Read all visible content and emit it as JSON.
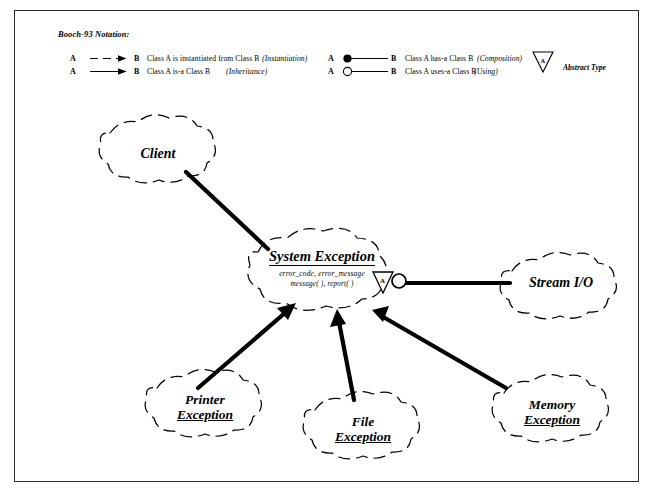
{
  "page": {
    "background": "#ffffff",
    "ink": "#000000",
    "frame_color": "#2b2b2b"
  },
  "legend": {
    "title": "Booch-93 Notation:",
    "rows": [
      {
        "id": "instantiation",
        "from": "A",
        "to": "B",
        "line_style": "dashed",
        "arrow": "solid-triangle",
        "description": "Class A  is instantiated from  Class B",
        "kind": "(Instantiation)"
      },
      {
        "id": "inheritance",
        "from": "A",
        "to": "B",
        "line_style": "solid",
        "arrow": "solid-triangle",
        "description": "Class A  is-a Class B",
        "kind": "(Inheritance)"
      },
      {
        "id": "composition",
        "from": "A",
        "to": "B",
        "line_style": "solid",
        "arrow": "filled-circle",
        "description": "Class A  has-a  Class B",
        "kind": "(Composition)"
      },
      {
        "id": "using",
        "from": "A",
        "to": "B",
        "line_style": "solid",
        "arrow": "open-circle",
        "description": "Class A  uses-a Class B",
        "kind": "(Using)"
      }
    ],
    "abstract_marker": {
      "glyph": "A",
      "label": "Abstract Type"
    }
  },
  "classes": [
    {
      "id": "client",
      "name": "Client",
      "lines": [
        "Client"
      ],
      "underline_first_letter": false
    },
    {
      "id": "system-exception",
      "name": "System Exception",
      "attributes": "error_code, error_message",
      "operations": "message( ), report( )",
      "abstract_glyph": "A",
      "is_abstract": true
    },
    {
      "id": "stream-io",
      "name": "Stream I/O",
      "lines": [
        "Stream I/O"
      ]
    },
    {
      "id": "printer-exception",
      "name": "Printer Exception",
      "lines": [
        "Printer",
        "Exception"
      ]
    },
    {
      "id": "file-exception",
      "name": "File Exception",
      "lines": [
        "File",
        "Exception"
      ]
    },
    {
      "id": "memory-exception",
      "name": "Memory Exception",
      "lines": [
        "Memory",
        "Exception"
      ]
    }
  ],
  "relationships": [
    {
      "id": "client-uses-sysexc",
      "from": "client",
      "to": "system-exception",
      "kind": "association"
    },
    {
      "id": "printer-isa-sysexc",
      "from": "printer-exception",
      "to": "system-exception",
      "kind": "inheritance"
    },
    {
      "id": "file-isa-sysexc",
      "from": "file-exception",
      "to": "system-exception",
      "kind": "inheritance"
    },
    {
      "id": "memory-isa-sysexc",
      "from": "memory-exception",
      "to": "system-exception",
      "kind": "inheritance"
    },
    {
      "id": "sysexc-uses-stream",
      "from": "system-exception",
      "to": "stream-io",
      "kind": "using"
    }
  ]
}
